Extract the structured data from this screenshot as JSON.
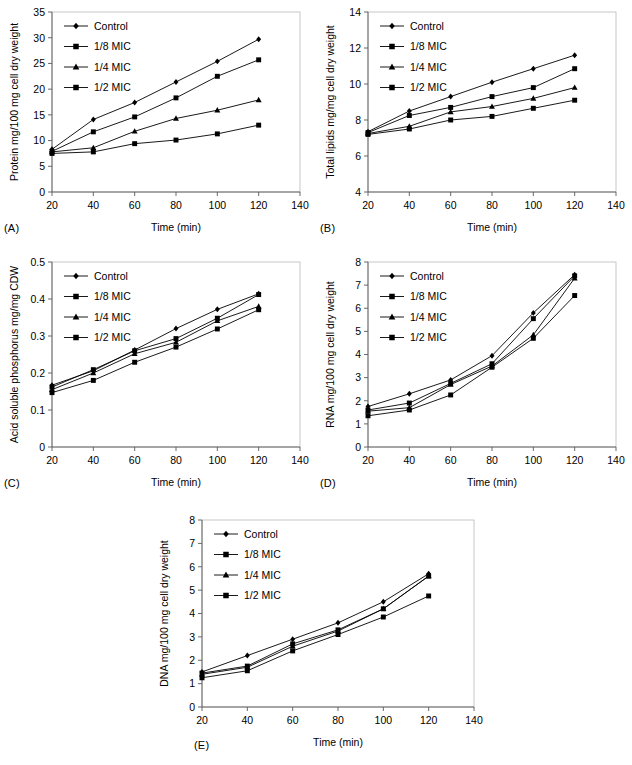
{
  "figure": {
    "background": "#ffffff",
    "series_color": "#000000",
    "frame_color": "#b9b9b9",
    "axis_color": "#5a5a5a",
    "series_names": [
      "Control",
      "1/8 MIC",
      "1/4 MIC",
      "1/2 MIC"
    ],
    "series_markers": [
      "diamond",
      "square",
      "triangle",
      "square"
    ]
  },
  "panels": [
    {
      "id": "A",
      "label": "(A)",
      "chart_data": {
        "type": "line",
        "title": "",
        "xlabel": "Time (min)",
        "ylabel": "Protein mg/100 mg cell dry weight",
        "x": [
          20,
          40,
          60,
          80,
          100,
          120
        ],
        "xlim": [
          20,
          140
        ],
        "xticks": [
          20,
          40,
          60,
          80,
          100,
          120,
          140
        ],
        "ylim": [
          0,
          35
        ],
        "yticks": [
          0,
          5,
          10,
          15,
          20,
          25,
          30,
          35
        ],
        "ytick_labels": [
          "0",
          "5",
          "10",
          "15",
          "20",
          "25",
          "30",
          "35"
        ],
        "grid": false,
        "legend": "top-left",
        "series": [
          {
            "name": "Control",
            "marker": "diamond",
            "values": [
              8.3,
              14.1,
              17.4,
              21.4,
              25.4,
              29.7
            ]
          },
          {
            "name": "1/8 MIC",
            "marker": "square",
            "values": [
              7.9,
              11.7,
              14.6,
              18.3,
              22.5,
              25.7
            ]
          },
          {
            "name": "1/4 MIC",
            "marker": "triangle",
            "values": [
              7.8,
              8.6,
              11.8,
              14.3,
              15.9,
              17.9
            ]
          },
          {
            "name": "1/2 MIC",
            "marker": "square",
            "values": [
              7.5,
              7.8,
              9.4,
              10.1,
              11.3,
              13.0
            ]
          }
        ]
      }
    },
    {
      "id": "B",
      "label": "(B)",
      "chart_data": {
        "type": "line",
        "title": "",
        "xlabel": "Time (min)",
        "ylabel": "Total lipids mg/mg cell dry weight",
        "x": [
          20,
          40,
          60,
          80,
          100,
          120
        ],
        "xlim": [
          20,
          140
        ],
        "xticks": [
          20,
          40,
          60,
          80,
          100,
          120,
          140
        ],
        "ylim": [
          4,
          14
        ],
        "yticks": [
          4,
          6,
          8,
          10,
          12,
          14
        ],
        "ytick_labels": [
          "4",
          "6",
          "8",
          "10",
          "12",
          "14"
        ],
        "grid": false,
        "legend": "top-left",
        "series": [
          {
            "name": "Control",
            "marker": "diamond",
            "values": [
              7.35,
              8.5,
              9.3,
              10.1,
              10.85,
              11.6
            ]
          },
          {
            "name": "1/8 MIC",
            "marker": "square",
            "values": [
              7.3,
              8.25,
              8.7,
              9.3,
              9.8,
              10.85
            ]
          },
          {
            "name": "1/4 MIC",
            "marker": "triangle",
            "values": [
              7.25,
              7.65,
              8.45,
              8.75,
              9.2,
              9.8
            ]
          },
          {
            "name": "1/2 MIC",
            "marker": "square",
            "values": [
              7.2,
              7.5,
              8.0,
              8.2,
              8.65,
              9.1
            ]
          }
        ]
      }
    },
    {
      "id": "C",
      "label": "(C)",
      "chart_data": {
        "type": "line",
        "title": "",
        "xlabel": "Time (min)",
        "ylabel": "Acid soluble phosphorus mg/mg CDW",
        "x": [
          20,
          40,
          60,
          80,
          100,
          120
        ],
        "xlim": [
          20,
          140
        ],
        "xticks": [
          20,
          40,
          60,
          80,
          100,
          120,
          140
        ],
        "ylim": [
          0,
          0.5
        ],
        "yticks": [
          0,
          0.1,
          0.2,
          0.3,
          0.4,
          0.5
        ],
        "ytick_labels": [
          "0",
          "0.1",
          "0.2",
          "0.3",
          "0.4",
          "0.5"
        ],
        "grid": false,
        "legend": "top-left",
        "series": [
          {
            "name": "Control",
            "marker": "diamond",
            "values": [
              0.167,
              0.206,
              0.262,
              0.32,
              0.372,
              0.414
            ]
          },
          {
            "name": "1/8 MIC",
            "marker": "square",
            "values": [
              0.162,
              0.209,
              0.26,
              0.293,
              0.348,
              0.412
            ]
          },
          {
            "name": "1/4 MIC",
            "marker": "triangle",
            "values": [
              0.155,
              0.2,
              0.252,
              0.283,
              0.341,
              0.38
            ]
          },
          {
            "name": "1/2 MIC",
            "marker": "square",
            "values": [
              0.147,
              0.18,
              0.229,
              0.27,
              0.319,
              0.371
            ]
          }
        ]
      }
    },
    {
      "id": "D",
      "label": "(D)",
      "chart_data": {
        "type": "line",
        "title": "",
        "xlabel": "Time (min)",
        "ylabel": "RNA mg/100 mg cell dry weight",
        "x": [
          20,
          40,
          60,
          80,
          100,
          120
        ],
        "xlim": [
          20,
          140
        ],
        "xticks": [
          20,
          40,
          60,
          80,
          100,
          120,
          140
        ],
        "ylim": [
          0,
          8
        ],
        "yticks": [
          0,
          1,
          2,
          3,
          4,
          5,
          6,
          7,
          8
        ],
        "ytick_labels": [
          "0",
          "1",
          "2",
          "3",
          "4",
          "5",
          "6",
          "7",
          "8"
        ],
        "grid": false,
        "legend": "top-left",
        "series": [
          {
            "name": "Control",
            "marker": "diamond",
            "values": [
              1.75,
              2.3,
              2.9,
              3.95,
              5.8,
              7.45
            ]
          },
          {
            "name": "1/8 MIC",
            "marker": "square",
            "values": [
              1.6,
              1.9,
              2.75,
              3.6,
              5.55,
              7.4
            ]
          },
          {
            "name": "1/4 MIC",
            "marker": "triangle",
            "values": [
              1.55,
              1.7,
              2.7,
              3.5,
              4.85,
              7.3
            ]
          },
          {
            "name": "1/2 MIC",
            "marker": "square",
            "values": [
              1.35,
              1.6,
              2.25,
              3.45,
              4.7,
              6.55
            ]
          }
        ]
      }
    },
    {
      "id": "E",
      "label": "(E)",
      "chart_data": {
        "type": "line",
        "title": "",
        "xlabel": "Time (min)",
        "ylabel": "DNA mg/100 mg cell dry weight",
        "x": [
          20,
          40,
          60,
          80,
          100,
          120
        ],
        "xlim": [
          20,
          140
        ],
        "xticks": [
          20,
          40,
          60,
          80,
          100,
          120,
          140
        ],
        "ylim": [
          0,
          8
        ],
        "yticks": [
          0,
          1,
          2,
          3,
          4,
          5,
          6,
          7,
          8
        ],
        "ytick_labels": [
          "0",
          "1",
          "2",
          "3",
          "4",
          "5",
          "6",
          "7",
          "8"
        ],
        "grid": false,
        "legend": "top-left",
        "series": [
          {
            "name": "Control",
            "marker": "diamond",
            "values": [
              1.5,
              2.2,
              2.9,
              3.6,
              4.5,
              5.7
            ]
          },
          {
            "name": "1/8 MIC",
            "marker": "square",
            "values": [
              1.45,
              1.75,
              2.7,
              3.3,
              4.2,
              5.6
            ]
          },
          {
            "name": "1/4 MIC",
            "marker": "triangle",
            "values": [
              1.4,
              1.7,
              2.6,
              3.25,
              4.2,
              5.6
            ]
          },
          {
            "name": "1/2 MIC",
            "marker": "square",
            "values": [
              1.25,
              1.55,
              2.4,
              3.1,
              3.85,
              4.75
            ]
          }
        ]
      }
    }
  ]
}
